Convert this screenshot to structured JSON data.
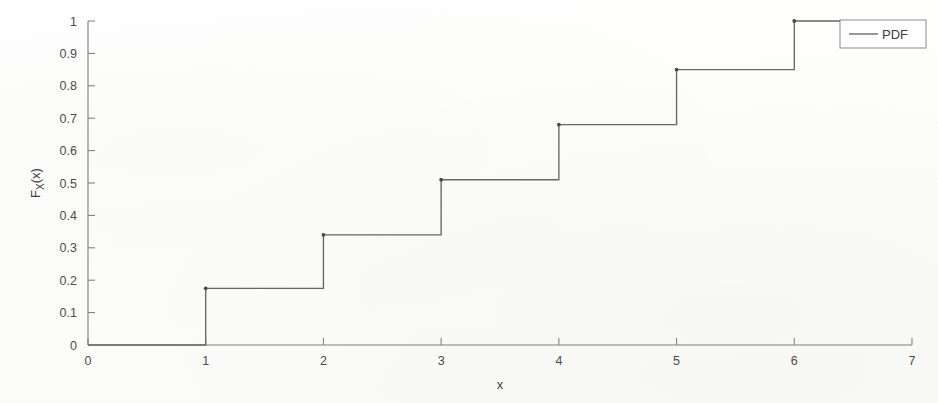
{
  "chart_data": {
    "type": "line",
    "subtype": "step-cdf",
    "title": "",
    "xlabel": "x",
    "ylabel": "F_X(x)",
    "ylabel_base": "F",
    "ylabel_sub": "X",
    "ylabel_arg": "(x)",
    "xlim": [
      0,
      7
    ],
    "ylim": [
      0,
      1
    ],
    "xticks": [
      0,
      1,
      2,
      3,
      4,
      5,
      6,
      7
    ],
    "xticklabels": [
      "0",
      "1",
      "2",
      "3",
      "4",
      "5",
      "6",
      "7"
    ],
    "yticks": [
      0,
      0.1,
      0.2,
      0.3,
      0.4,
      0.5,
      0.6,
      0.7,
      0.8,
      0.9,
      1
    ],
    "yticklabels": [
      "0",
      "0.1",
      "0.2",
      "0.3",
      "0.4",
      "0.5",
      "0.6",
      "0.7",
      "0.8",
      "0.9",
      "1"
    ],
    "grid": false,
    "legend": {
      "position": "top-right",
      "entries": [
        "PDF"
      ]
    },
    "series": [
      {
        "name": "PDF",
        "color": "#666666",
        "step_points": [
          {
            "x": 0,
            "y": 0
          },
          {
            "x": 1,
            "y": 0.175
          },
          {
            "x": 2,
            "y": 0.34
          },
          {
            "x": 3,
            "y": 0.51
          },
          {
            "x": 4,
            "y": 0.68
          },
          {
            "x": 5,
            "y": 0.85
          },
          {
            "x": 6,
            "y": 1.0
          },
          {
            "x": 7,
            "y": 1.0
          }
        ],
        "x": [
          0,
          1,
          2,
          3,
          4,
          5,
          6,
          7
        ],
        "y": [
          0,
          0.175,
          0.34,
          0.51,
          0.68,
          0.85,
          1.0,
          1.0
        ]
      }
    ]
  },
  "legend": {
    "label": "PDF"
  },
  "axes": {
    "x_title": "x",
    "y_title": "F_X(x)"
  }
}
